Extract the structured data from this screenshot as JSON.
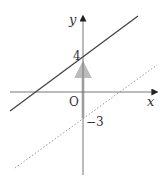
{
  "diagram": {
    "type": "coordinate-plane",
    "axes": {
      "x_label": "x",
      "y_label": "y",
      "origin_label": "O",
      "color": "#555555"
    },
    "lines": [
      {
        "name": "solid-line",
        "style": "solid",
        "y_intercept": 4,
        "intercept_label": "4",
        "color": "#444444"
      },
      {
        "name": "dashed-line",
        "style": "dotted",
        "y_intercept": -3,
        "intercept_label": "−3",
        "color": "#888888"
      }
    ],
    "translation_arrow": {
      "from_y": -3,
      "to_y": 4,
      "direction": "up",
      "color": "#bbbbbb"
    }
  }
}
